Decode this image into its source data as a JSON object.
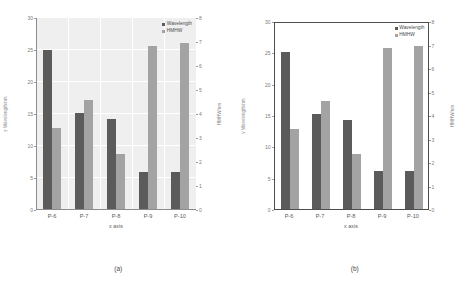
{
  "figure": {
    "panels": [
      {
        "caption": "(a)",
        "style": "gridded"
      },
      {
        "caption": "(b)",
        "style": "plain"
      }
    ]
  },
  "chart_data": [
    {
      "type": "bar",
      "title": "",
      "subtitle": "",
      "caption": "(a)",
      "categories": [
        "P-6",
        "P-7",
        "P-8",
        "P-9",
        "P-10"
      ],
      "series": [
        {
          "name": "Wavelength",
          "axis": "left",
          "values": [
            25,
            15.2,
            14.2,
            6,
            6
          ],
          "color": "#5b5b5b"
        },
        {
          "name": "HMHW",
          "axis": "right",
          "values": [
            3.4,
            4.6,
            2.35,
            6.85,
            6.95
          ],
          "color": "#a3a3a3"
        }
      ],
      "xlabel": "x axis",
      "ylabel": "y Wavelength/nm",
      "y2label": "HMHW/nm",
      "ylim": [
        0,
        30
      ],
      "y2lim": [
        0,
        8
      ],
      "yticks": [
        0,
        5,
        10,
        15,
        20,
        25,
        30
      ],
      "y2ticks": [
        0,
        1,
        2,
        3,
        4,
        5,
        6,
        7,
        8
      ],
      "grid": true,
      "legend_position": "top-right"
    },
    {
      "type": "bar",
      "title": "",
      "subtitle": "",
      "caption": "(b)",
      "categories": [
        "P-6",
        "P-7",
        "P-8",
        "P-9",
        "P-10"
      ],
      "series": [
        {
          "name": "Wavelength",
          "axis": "left",
          "values": [
            25,
            15.2,
            14.2,
            6,
            6
          ],
          "color": "#5b5b5b"
        },
        {
          "name": "HMHW",
          "axis": "right",
          "values": [
            3.4,
            4.6,
            2.35,
            6.85,
            6.95
          ],
          "color": "#a3a3a3"
        }
      ],
      "xlabel": "x axis",
      "ylabel": "y Wavelength/nm",
      "y2label": "HMHW/nm",
      "ylim": [
        0,
        30
      ],
      "y2lim": [
        0,
        8
      ],
      "yticks": [
        0,
        5,
        10,
        15,
        20,
        25,
        30
      ],
      "y2ticks": [
        0,
        1,
        2,
        3,
        4,
        5,
        6,
        7,
        8
      ],
      "grid": false,
      "legend_position": "top-right"
    }
  ]
}
